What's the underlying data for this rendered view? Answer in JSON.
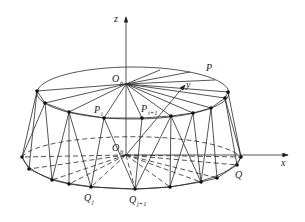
{
  "figure": {
    "title": "",
    "labels": {
      "z_axis": "z",
      "x_axis": "x",
      "y_axis": "y",
      "top_center": {
        "main": "O",
        "sub": "p"
      },
      "bottom_center": {
        "main": "O",
        "sub": "b"
      },
      "top_curve": "P",
      "bottom_curve": "Q",
      "p_i": {
        "main": "P",
        "sub": "i"
      },
      "p_i1": {
        "main": "P",
        "sub": "i+1"
      },
      "q_j": {
        "main": "Q",
        "sub": "j"
      },
      "q_j1": {
        "main": "Q",
        "sub": "j+1"
      }
    }
  }
}
